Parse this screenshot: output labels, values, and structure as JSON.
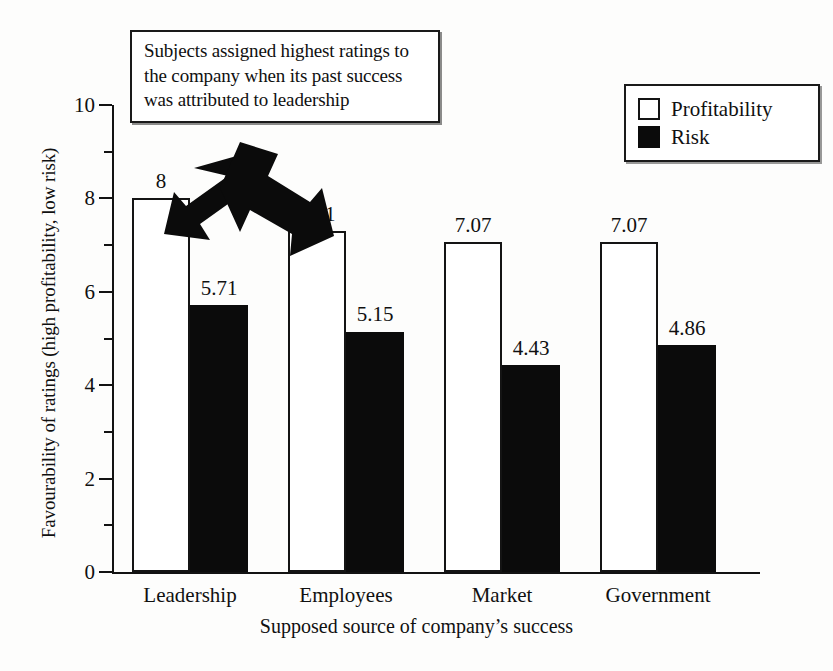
{
  "chart_data": {
    "type": "bar",
    "title": "",
    "xlabel": "Supposed source of company’s success",
    "ylabel": "Favourability of ratings (high profitability, low risk)",
    "categories": [
      "Leadership",
      "Employees",
      "Market",
      "Government"
    ],
    "series": [
      {
        "name": "Profitability",
        "values": [
          8,
          7.31,
          7.07,
          7.07
        ],
        "labels": [
          "8",
          "7.31",
          "7.07",
          "7.07"
        ],
        "color": "#ffffff"
      },
      {
        "name": "Risk",
        "values": [
          5.71,
          5.15,
          4.43,
          4.86
        ],
        "labels": [
          "5.71",
          "5.15",
          "4.43",
          "4.86"
        ],
        "color": "#0b0b0b"
      }
    ],
    "ylim": [
      0,
      10
    ],
    "yticks": [
      0,
      2,
      4,
      6,
      8,
      10
    ],
    "ytick_labels": [
      "0",
      "2",
      "4",
      "6",
      "8",
      "10"
    ],
    "yminor_ticks": [
      1,
      3,
      5,
      7,
      9
    ],
    "grid": false,
    "legend_position": "top-right",
    "annotations": [
      {
        "name": "callout",
        "text": "Subjects assigned highest ratings to the company when its past success was attributed to leadership",
        "lines": [
          "Subjects assigned highest ratings to",
          "the company when its past success",
          "was attributed to leadership"
        ]
      },
      {
        "name": "arrow-down-left",
        "icon": "block-arrow-icon",
        "points_to": "Leadership Profitability"
      },
      {
        "name": "arrow-down-right",
        "icon": "block-arrow-icon",
        "points_to": "Leadership Risk"
      }
    ]
  },
  "legend": {
    "items": [
      {
        "label": "Profitability",
        "swatch": "hollow-square-icon"
      },
      {
        "label": "Risk",
        "swatch": "filled-square-icon"
      }
    ]
  },
  "axes": {
    "y_title": "Favourability of ratings (high profitability, low risk)",
    "x_title": "Supposed source of company’s success"
  },
  "colors": {
    "ink": "#121212",
    "paper": "#fdfdfc",
    "profitability": "#ffffff",
    "risk": "#0b0b0b"
  }
}
